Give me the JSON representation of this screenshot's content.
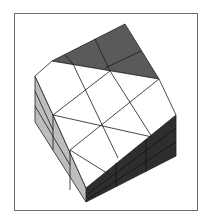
{
  "figure": {
    "colors": {
      "frame": "#6e6e6e",
      "top_face": "#5a5a5a",
      "front_face": "#ffffff",
      "left_face": "#bdbdbd",
      "right_face": "#2e2e2e",
      "grid_line": "#222222"
    }
  }
}
